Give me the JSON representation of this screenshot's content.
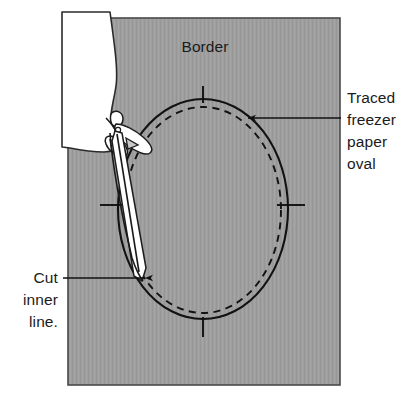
{
  "figure": {
    "background_color": "#ffffff",
    "fabric_color": "#9e9e9e",
    "line_color": "#121212",
    "hand_color": "#ffffff"
  },
  "labels": {
    "border": {
      "text": "Border",
      "lines": [
        "Border"
      ],
      "x": 205,
      "y": 52
    },
    "traced_oval": {
      "lines": [
        "Traced",
        "freezer",
        "paper",
        "oval"
      ],
      "x": 347,
      "y": 103,
      "line_height": 22
    },
    "cut_inner": {
      "lines": [
        "Cut",
        "inner",
        "line."
      ],
      "x": 62,
      "y": 278,
      "line_height": 22
    }
  },
  "annotations": {
    "traced_oval_arrow": {
      "name": "arrow-to-oval",
      "from_x": 341,
      "from_y": 118,
      "to_x": 244,
      "to_y": 118,
      "direction": "left"
    },
    "cut_inner_arrow": {
      "name": "arrow-to-cut-line",
      "from_x": 63,
      "from_y": 278,
      "to_x": 149,
      "to_y": 278,
      "direction": "right"
    }
  },
  "shapes": {
    "fabric_rect": {
      "x": 68,
      "y": 18,
      "width": 272,
      "height": 367
    },
    "oval_solid": {
      "cx": 203,
      "cy": 209,
      "rx": 85,
      "ry": 110
    },
    "oval_dashed": {
      "cx": 203,
      "cy": 210,
      "rx": 78,
      "ry": 103
    },
    "ticks": [
      {
        "name": "tick-top",
        "x1": 203,
        "y1": 86,
        "x2": 203,
        "y2": 103
      },
      {
        "name": "tick-right",
        "x1": 277,
        "y1": 205,
        "x2": 305,
        "y2": 205
      },
      {
        "name": "tick-bottom",
        "x1": 203,
        "y1": 317,
        "x2": 203,
        "y2": 337
      },
      {
        "name": "tick-left",
        "x1": 100,
        "y1": 205,
        "x2": 126,
        "y2": 205
      }
    ]
  }
}
